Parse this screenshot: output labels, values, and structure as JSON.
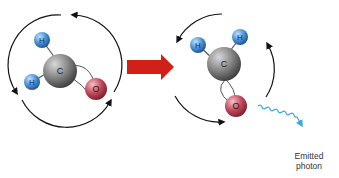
{
  "diagram": {
    "left_molecule": {
      "atoms": [
        {
          "symbol": "H",
          "color": "#4a8fd0"
        },
        {
          "symbol": "H",
          "color": "#4a8fd0"
        },
        {
          "symbol": "C",
          "color": "#7a7a7a"
        },
        {
          "symbol": "O",
          "color": "#c0485a"
        }
      ],
      "rotation": "clockwise"
    },
    "transition_arrow": {
      "color": "#d02018"
    },
    "right_molecule": {
      "atoms": [
        {
          "symbol": "H",
          "color": "#4a8fd0"
        },
        {
          "symbol": "H",
          "color": "#4a8fd0"
        },
        {
          "symbol": "C",
          "color": "#7a7a7a"
        },
        {
          "symbol": "O",
          "color": "#c0485a"
        }
      ],
      "rotation": "counterclockwise"
    },
    "photon": {
      "color": "#3aa8d8",
      "label_line1": "Emitted",
      "label_line2": "photon"
    }
  }
}
